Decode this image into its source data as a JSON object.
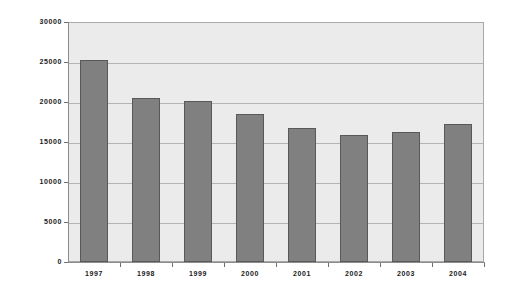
{
  "chart_data": {
    "type": "bar",
    "title": "",
    "subtitle": "",
    "xlabel": "",
    "ylabel": "",
    "categories": [
      "1997",
      "1998",
      "1999",
      "2000",
      "2001",
      "2002",
      "2003",
      "2004"
    ],
    "values": [
      25200,
      20500,
      20100,
      18500,
      16700,
      15900,
      16200,
      17200
    ],
    "ylim": [
      0,
      30000
    ],
    "ytick_labels": [
      "30000",
      "25000",
      "20000",
      "15000",
      "10000",
      "5000",
      "0"
    ],
    "ytick_values": [
      30000,
      25000,
      20000,
      15000,
      10000,
      5000,
      0
    ],
    "grid": true,
    "legend": false,
    "legend_position": "none",
    "series": [
      {
        "name": "",
        "values": [
          25200,
          20500,
          20100,
          18500,
          16700,
          15900,
          16200,
          17200
        ]
      }
    ],
    "colors": {
      "bar_fill": "#808080",
      "bar_edge": "#595959",
      "plot_background": "#ebebeb",
      "gridline": "#b4b4b4",
      "axis": "#8c8c8c",
      "text": "#1a1a1a",
      "figure_background": "#ffffff"
    }
  }
}
